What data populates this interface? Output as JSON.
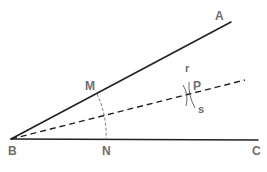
{
  "figure": {
    "points": {
      "A": {
        "label": "A"
      },
      "B": {
        "label": "B"
      },
      "C": {
        "label": "C"
      },
      "M": {
        "label": "M"
      },
      "N": {
        "label": "N"
      },
      "P": {
        "label": "P"
      }
    },
    "arcs": {
      "r": {
        "label": "r"
      },
      "s": {
        "label": "s"
      }
    },
    "segments": [
      {
        "name": "ray-BA",
        "from": "B",
        "to": "A",
        "style": "solid"
      },
      {
        "name": "ray-BC",
        "from": "B",
        "to": "C",
        "style": "solid"
      },
      {
        "name": "bisector-BP",
        "from": "B",
        "through": "P",
        "style": "dashed"
      },
      {
        "name": "arc-MN",
        "from": "M",
        "to": "N",
        "center": "B",
        "style": "dashed"
      }
    ],
    "colors": {
      "lines": "#222222",
      "labels": "#6e6e6e",
      "construction": "#555555"
    }
  }
}
